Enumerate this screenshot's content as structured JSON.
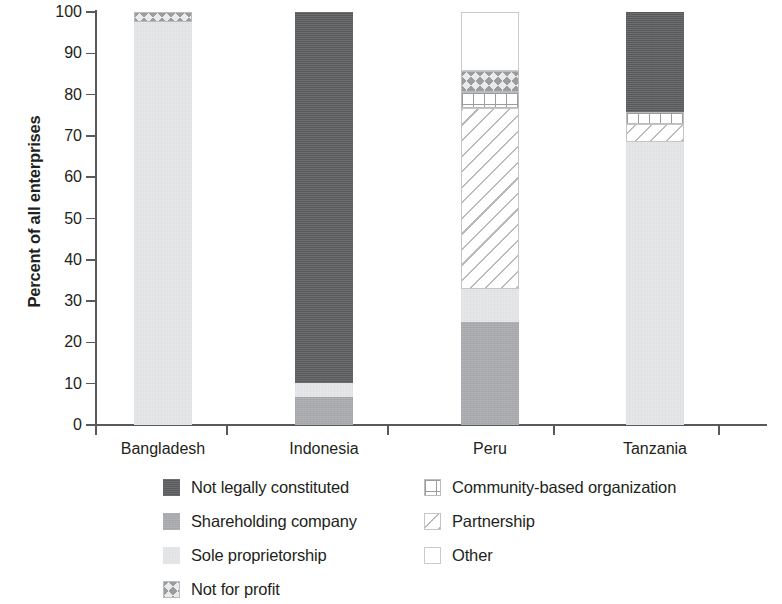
{
  "chart_data": {
    "type": "bar",
    "subtype": "stacked-bar-100",
    "title": "",
    "xlabel": "",
    "ylabel": "Percent of all enterprises",
    "ylim": [
      0,
      100
    ],
    "y_ticks": [
      0,
      10,
      20,
      30,
      40,
      50,
      60,
      70,
      80,
      90,
      100
    ],
    "grid": false,
    "legend_position": "bottom",
    "categories": [
      "Bangladesh",
      "Indonesia",
      "Peru",
      "Tanzania"
    ],
    "series": [
      {
        "name": "Sole proprietorship",
        "pattern": "solid-light",
        "color": "#e3e4e5",
        "values": [
          97.5,
          3.4,
          8.0,
          68.5
        ]
      },
      {
        "name": "Shareholding company",
        "pattern": "solid-medium",
        "color": "#a6a8ab",
        "values": [
          0,
          6.8,
          24.9,
          0
        ]
      },
      {
        "name": "Not legally constituted",
        "pattern": "solid-dark",
        "color": "#595a5c",
        "values": [
          0,
          89.8,
          0,
          24.2
        ]
      },
      {
        "name": "Partnership",
        "pattern": "diagonal-hatch",
        "color": "#ffffff",
        "values": [
          0,
          0,
          43.9,
          4.4
        ]
      },
      {
        "name": "Community-based organization",
        "pattern": "grid-hatch",
        "color": "#ffffff",
        "values": [
          0,
          0,
          3.8,
          2.9
        ]
      },
      {
        "name": "Not for profit",
        "pattern": "crosshatch",
        "color": "#e9eaeb",
        "values": [
          2.5,
          0,
          5.1,
          0
        ]
      },
      {
        "name": "Other",
        "pattern": "open-white",
        "color": "#ffffff",
        "values": [
          0,
          0,
          14.3,
          0
        ]
      }
    ],
    "stack_order_bottom_to_top": [
      "Shareholding company",
      "Sole proprietorship",
      "Partnership",
      "Community-based organization",
      "Not legally constituted",
      "Not for profit",
      "Other"
    ],
    "bars": [
      {
        "category": "Bangladesh",
        "segments": [
          {
            "name": "Sole proprietorship",
            "from": 0,
            "to": 97.5
          },
          {
            "name": "Not for profit",
            "from": 97.5,
            "to": 100
          }
        ]
      },
      {
        "category": "Indonesia",
        "segments": [
          {
            "name": "Shareholding company",
            "from": 0,
            "to": 6.8
          },
          {
            "name": "Sole proprietorship",
            "from": 6.8,
            "to": 10.2
          },
          {
            "name": "Not legally constituted",
            "from": 10.2,
            "to": 100
          }
        ]
      },
      {
        "category": "Peru",
        "segments": [
          {
            "name": "Shareholding company",
            "from": 0,
            "to": 24.9
          },
          {
            "name": "Sole proprietorship",
            "from": 24.9,
            "to": 32.9
          },
          {
            "name": "Partnership",
            "from": 32.9,
            "to": 76.8
          },
          {
            "name": "Community-based organization",
            "from": 76.8,
            "to": 80.6
          },
          {
            "name": "Not for profit",
            "from": 80.6,
            "to": 85.7
          },
          {
            "name": "Other",
            "from": 85.7,
            "to": 100
          }
        ]
      },
      {
        "category": "Tanzania",
        "segments": [
          {
            "name": "Sole proprietorship",
            "from": 0,
            "to": 68.5
          },
          {
            "name": "Partnership",
            "from": 68.5,
            "to": 72.9
          },
          {
            "name": "Community-based organization",
            "from": 72.9,
            "to": 75.8
          },
          {
            "name": "Not legally constituted",
            "from": 75.8,
            "to": 100
          }
        ]
      }
    ]
  },
  "axis": {
    "y_title": "Percent of all enterprises",
    "y_ticks": [
      "100",
      "90",
      "80",
      "70",
      "60",
      "50",
      "40",
      "30",
      "20",
      "10",
      "0"
    ],
    "x_labels": [
      "Bangladesh",
      "Indonesia",
      "Peru",
      "Tanzania"
    ]
  },
  "legend": {
    "items": [
      {
        "label": "Not legally constituted",
        "swatch": "solid-dark"
      },
      {
        "label": "Community-based organization",
        "swatch": "grid-hatch"
      },
      {
        "label": "Shareholding company",
        "swatch": "solid-medium"
      },
      {
        "label": "Partnership",
        "swatch": "diagonal-hatch"
      },
      {
        "label": "Sole proprietorship",
        "swatch": "solid-light"
      },
      {
        "label": "Other",
        "swatch": "open-white"
      },
      {
        "label": "Not for profit",
        "swatch": "crosshatch"
      }
    ]
  },
  "colors": {
    "dark": "#595a5c",
    "medium": "#a6a8ab",
    "light": "#e3e4e5",
    "hatch": "#9a9c9e",
    "axis": "#58595b",
    "text": "#231f20"
  }
}
